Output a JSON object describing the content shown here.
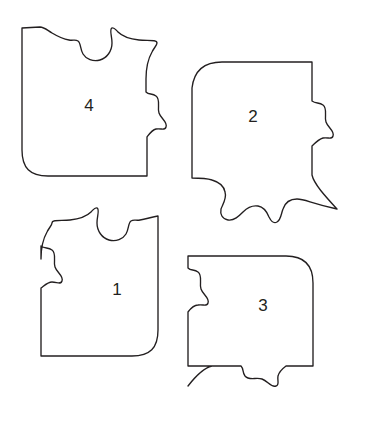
{
  "figure": {
    "kind": "jigsaw-puzzle-pieces-diagram",
    "background_color": "#ffffff",
    "stroke_color": "#231f20",
    "fill_color": "#ffffff",
    "stroke_width": 1.35,
    "piece_count": 4,
    "canvas": {
      "width": 369,
      "height": 421
    }
  },
  "pieces": [
    {
      "id": "piece-4",
      "label": "4",
      "position": "top-left",
      "label_x": 89,
      "label_y": 107,
      "corner_style": "rounded-bottom-left",
      "edges": {
        "top": "blank",
        "right": "tab",
        "bottom": "straight",
        "left": "straight"
      },
      "path": "M 22 28 L 22 150 C 22 168 30 176 48 176 L 147 176 L 147 137 C 150 133 152 130 156 129 C 161 128 165 131 166 127 C 168 122 161 119 159 113 C 157 107 161 100 156 96 C 152 93 149 95 146 92 L 146 79 C 146 68 148 59 152 52 C 154 48 157 45 157 43 C 157 39 147 41 139 40 C 130 39 122 36 118 32 C 115 29 114 27 112 28 C 109 29 112 36 112 43 C 112 51 107 58 100 60 C 93 62 86 59 83 54 C 80 49 81 43 78 41 C 75 39 73 41 69 40 C 63 39 57 36 52 33 C 47 30 44 27 40 27 Z"
    },
    {
      "id": "piece-2",
      "label": "2",
      "position": "top-right",
      "label_x": 253,
      "label_y": 118,
      "corner_style": "rounded-top-left-pointed-bottom-right",
      "edges": {
        "top": "straight",
        "right": "tab",
        "bottom": "blank",
        "left": "straight"
      },
      "path": "M 312 62 L 222 62 C 204 62 194 71 192 88 L 192 178 C 199 178 206 178 212 180 C 219 182 224 186 225 192 C 227 198 223 204 221 209 C 220 214 222 219 228 220 C 234 221 239 216 243 212 C 247 208 252 205 258 206 C 264 207 267 212 269 217 C 271 221 273 224 277 222 C 281 220 281 214 283 209 C 285 203 290 199 297 199 C 305 199 310 203 337 209 C 325 196 314 184 312 175 L 312 146 C 316 142 319 139 323 138 C 328 137 332 140 333 136 C 335 131 328 128 326 122 C 324 116 328 109 323 105 C 319 102 316 104 312 101 Z"
    },
    {
      "id": "piece-1",
      "label": "1",
      "position": "bottom-left",
      "label_x": 117,
      "label_y": 291,
      "corner_style": "rounded-bottom-right",
      "edges": {
        "top": "blank",
        "right": "straight",
        "bottom": "straight",
        "left": "blank"
      },
      "path": "M 158 216 L 158 330 C 158 348 150 356 132 356 L 41 356 L 41 288 C 45 285 48 282 52 282 C 57 282 61 285 62 281 C 64 276 57 273 55 267 C 53 261 57 254 52 250 C 48 247 45 249 41 246 L 41 259 C 41 248 43 239 47 232 C 49 228 52 225 52 223 C 52 219 62 221 70 220 C 79 219 87 216 91 212 C 94 209 95 207 97 208 C 100 209 97 216 97 223 C 97 231 102 238 109 240 C 116 242 123 239 126 234 C 129 229 128 223 131 221 C 134 219 136 221 140 220 C 146 219 152 217 158 216 Z"
    },
    {
      "id": "piece-3",
      "label": "3",
      "position": "bottom-right",
      "label_x": 263,
      "label_y": 307,
      "corner_style": "rounded-top-right",
      "edges": {
        "top": "straight",
        "right": "straight",
        "bottom": "tab",
        "left": "blank"
      },
      "path": "M 188 256 L 286 256 C 304 256 313 265 313 283 L 313 366 L 286 366 C 282 369 279 372 278 376 C 277 381 280 385 276 386 C 271 388 268 381 262 379 C 256 377 249 381 245 376 C 242 372 244 369 241 366 L 212 366 C 203 368 195 377 188 386 C 195 377 203 368 212 366 L 188 366 L 188 312 C 191 308 194 305 198 305 C 203 304 207 307 208 303 C 210 298 203 295 201 289 C 199 283 203 276 198 272 C 194 269 191 271 188 268 Z"
    }
  ]
}
